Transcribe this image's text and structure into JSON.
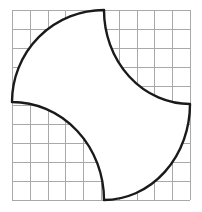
{
  "figure": {
    "canvas": {
      "width": 202,
      "height": 212,
      "background": "#ffffff"
    },
    "grid": {
      "visible": true,
      "columns": 10,
      "rows": 10,
      "x_start": 12,
      "y_start": 10,
      "x_end": 190,
      "y_end": 200,
      "cell_width": 17.8,
      "cell_height": 19.0,
      "line_color": "#a9a9a9",
      "line_width": 1
    },
    "shape": {
      "name": "pinwheel-four-arcs",
      "stroke_color": "#1a1a1a",
      "fill_color": "#ffffff",
      "stroke_width": 2.4,
      "vertices": [
        {
          "name": "top-vertex",
          "x": 104,
          "y": 10
        },
        {
          "name": "right-vertex",
          "x": 190,
          "y": 104
        },
        {
          "name": "bottom-vertex",
          "x": 104,
          "y": 200
        },
        {
          "name": "left-vertex",
          "x": 12,
          "y": 102
        }
      ],
      "arcs": [
        {
          "name": "top-right-arc",
          "from": "top-vertex",
          "to": "right-vertex",
          "curvature": "concave",
          "sweep": 0,
          "radius_x": 86,
          "radius_y": 94,
          "center_x": 190,
          "center_y": 10
        },
        {
          "name": "bottom-right-arc",
          "from": "right-vertex",
          "to": "bottom-vertex",
          "curvature": "convex",
          "sweep": 1,
          "radius_x": 86,
          "radius_y": 96,
          "center_x": 104,
          "center_y": 104
        },
        {
          "name": "bottom-left-arc",
          "from": "bottom-vertex",
          "to": "left-vertex",
          "curvature": "concave",
          "sweep": 0,
          "radius_x": 92,
          "radius_y": 98,
          "center_x": 12,
          "center_y": 200
        },
        {
          "name": "top-left-arc",
          "from": "left-vertex",
          "to": "top-vertex",
          "curvature": "convex",
          "sweep": 1,
          "radius_x": 92,
          "radius_y": 92,
          "center_x": 104,
          "center_y": 102
        }
      ]
    }
  }
}
